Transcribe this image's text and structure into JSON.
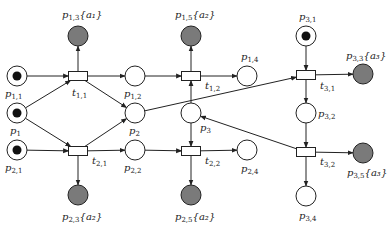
{
  "diagram": {
    "type": "petri-net",
    "colors": {
      "stroke": "#222222",
      "final_place_fill": "#7a7a7a",
      "token": "#111111",
      "background": "#ffffff"
    },
    "places": [
      {
        "id": "p11",
        "name": "p",
        "sub": "1,1",
        "ann": "",
        "x": 17,
        "y": 76,
        "token": true,
        "final": false,
        "lx": 5,
        "ly": 97
      },
      {
        "id": "p1",
        "name": "p",
        "sub": "1",
        "ann": "",
        "x": 17,
        "y": 113,
        "token": true,
        "final": false,
        "lx": 10,
        "ly": 134
      },
      {
        "id": "p21",
        "name": "p",
        "sub": "2,1",
        "ann": "",
        "x": 17,
        "y": 150,
        "token": true,
        "final": false,
        "lx": 5,
        "ly": 171
      },
      {
        "id": "p13",
        "name": "p",
        "sub": "1,3",
        "ann": "{a₁}",
        "x": 78,
        "y": 36,
        "token": false,
        "final": true,
        "lx": 62,
        "ly": 18
      },
      {
        "id": "p23",
        "name": "p",
        "sub": "2,3",
        "ann": "{a₂}",
        "x": 78,
        "y": 195,
        "token": false,
        "final": true,
        "lx": 62,
        "ly": 220
      },
      {
        "id": "p12",
        "name": "p",
        "sub": "1,2",
        "ann": "",
        "x": 135,
        "y": 76,
        "token": false,
        "final": false,
        "lx": 124,
        "ly": 97
      },
      {
        "id": "p2",
        "name": "p",
        "sub": "2",
        "ann": "",
        "x": 135,
        "y": 113,
        "token": false,
        "final": false,
        "lx": 129,
        "ly": 134
      },
      {
        "id": "p22",
        "name": "p",
        "sub": "2,2",
        "ann": "",
        "x": 135,
        "y": 150,
        "token": false,
        "final": false,
        "lx": 124,
        "ly": 171
      },
      {
        "id": "p15",
        "name": "p",
        "sub": "1,5",
        "ann": "{a₂}",
        "x": 191,
        "y": 36,
        "token": false,
        "final": true,
        "lx": 175,
        "ly": 18
      },
      {
        "id": "p3",
        "name": "p",
        "sub": "3",
        "ann": "",
        "x": 191,
        "y": 113,
        "token": false,
        "final": false,
        "lx": 200,
        "ly": 131
      },
      {
        "id": "p25",
        "name": "p",
        "sub": "2,5",
        "ann": "{a₂}",
        "x": 191,
        "y": 195,
        "token": false,
        "final": true,
        "lx": 175,
        "ly": 220
      },
      {
        "id": "p14",
        "name": "p",
        "sub": "1,4",
        "ann": "",
        "x": 247,
        "y": 76,
        "token": false,
        "final": false,
        "lx": 241,
        "ly": 60
      },
      {
        "id": "p24",
        "name": "p",
        "sub": "2,4",
        "ann": "",
        "x": 247,
        "y": 150,
        "token": false,
        "final": false,
        "lx": 241,
        "ly": 172
      },
      {
        "id": "p31",
        "name": "p",
        "sub": "3,1",
        "ann": "",
        "x": 306,
        "y": 36,
        "token": true,
        "final": false,
        "lx": 299,
        "ly": 20
      },
      {
        "id": "p33",
        "name": "p",
        "sub": "3,3",
        "ann": "{a₃}",
        "x": 363,
        "y": 74,
        "token": false,
        "final": true,
        "lx": 346,
        "ly": 59
      },
      {
        "id": "p32",
        "name": "p",
        "sub": "3,2",
        "ann": "",
        "x": 306,
        "y": 113,
        "token": false,
        "final": false,
        "lx": 318,
        "ly": 117
      },
      {
        "id": "p35",
        "name": "p",
        "sub": "3,5",
        "ann": "{a₃}",
        "x": 363,
        "y": 153,
        "token": false,
        "final": true,
        "lx": 347,
        "ly": 176
      },
      {
        "id": "p34",
        "name": "p",
        "sub": "3,4",
        "ann": "",
        "x": 306,
        "y": 196,
        "token": false,
        "final": false,
        "lx": 299,
        "ly": 219
      }
    ],
    "transitions": [
      {
        "id": "t11",
        "name": "t",
        "sub": "1,1",
        "x": 78,
        "y": 76,
        "lx": 72,
        "ly": 96
      },
      {
        "id": "t21",
        "name": "t",
        "sub": "2,1",
        "x": 78,
        "y": 151,
        "lx": 92,
        "ly": 164
      },
      {
        "id": "t12",
        "name": "t",
        "sub": "1,2",
        "x": 191,
        "y": 76,
        "lx": 205,
        "ly": 89
      },
      {
        "id": "t22",
        "name": "t",
        "sub": "2,2",
        "x": 191,
        "y": 151,
        "lx": 205,
        "ly": 164
      },
      {
        "id": "t31",
        "name": "t",
        "sub": "3,1",
        "x": 306,
        "y": 75,
        "lx": 320,
        "ly": 89
      },
      {
        "id": "t32",
        "name": "t",
        "sub": "3,2",
        "x": 306,
        "y": 152,
        "lx": 320,
        "ly": 165
      }
    ],
    "arcs": [
      [
        "p11",
        "t11"
      ],
      [
        "p1",
        "t11"
      ],
      [
        "p1",
        "t21"
      ],
      [
        "p21",
        "t21"
      ],
      [
        "t11",
        "p13"
      ],
      [
        "t11",
        "p12"
      ],
      [
        "t11",
        "p2"
      ],
      [
        "t21",
        "p23"
      ],
      [
        "t21",
        "p22"
      ],
      [
        "t21",
        "p2"
      ],
      [
        "p12",
        "t12"
      ],
      [
        "p3",
        "t12"
      ],
      [
        "t12",
        "p15"
      ],
      [
        "t12",
        "p14"
      ],
      [
        "p22",
        "t22"
      ],
      [
        "p3",
        "t22"
      ],
      [
        "t22",
        "p25"
      ],
      [
        "t22",
        "p24"
      ],
      [
        "p31",
        "t31"
      ],
      [
        "p2",
        "t31"
      ],
      [
        "t31",
        "p33"
      ],
      [
        "t31",
        "p32"
      ],
      [
        "p32",
        "t32"
      ],
      [
        "t32",
        "p35"
      ],
      [
        "t32",
        "p34"
      ],
      [
        "t32",
        "p3"
      ]
    ]
  }
}
